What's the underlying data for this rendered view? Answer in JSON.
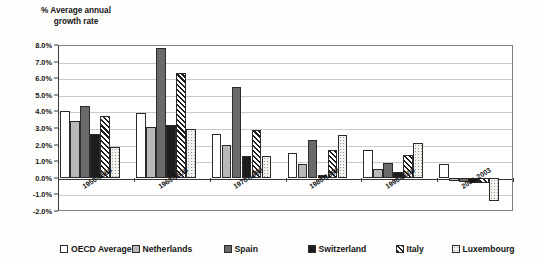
{
  "chart_data": {
    "type": "bar",
    "title": "% Average annual\ngrowth rate",
    "xlabel": "",
    "ylabel": "% Average annual growth rate",
    "ylim": [
      -2.0,
      8.0
    ],
    "ytick_step": 1.0,
    "ytick_labels": [
      "8.0%",
      "7.0%",
      "6.0%",
      "5.0%",
      "4.0%",
      "3.0%",
      "2.0%",
      "1.0%",
      "0.0%",
      "-1.0%",
      "-2.0%"
    ],
    "ytick_values": [
      8.0,
      7.0,
      6.0,
      5.0,
      4.0,
      3.0,
      2.0,
      1.0,
      0.0,
      -1.0,
      -2.0
    ],
    "grid": true,
    "legend_position": "bottom",
    "categories": [
      "1950-1960",
      "1960-1970",
      "1970-1980",
      "1980-1990",
      "1990-2000",
      "2000-2003"
    ],
    "series": [
      {
        "name": "OECD Average",
        "pattern": "white",
        "values": [
          4.05,
          3.92,
          2.62,
          1.5,
          1.7,
          0.85
        ]
      },
      {
        "name": "Netherlands",
        "pattern": "light-grey",
        "values": [
          3.42,
          3.08,
          1.98,
          0.85,
          0.55,
          -0.18
        ]
      },
      {
        "name": "Spain",
        "pattern": "dark-grey",
        "values": [
          4.32,
          7.8,
          5.45,
          2.3,
          0.9,
          -0.28
        ]
      },
      {
        "name": "Switzerland",
        "pattern": "black",
        "values": [
          2.65,
          3.18,
          1.3,
          0.15,
          0.35,
          -0.32
        ]
      },
      {
        "name": "Italy",
        "pattern": "diagonal-hatch",
        "values": [
          3.72,
          6.3,
          2.87,
          1.65,
          1.35,
          -0.3
        ]
      },
      {
        "name": "Luxembourg",
        "pattern": "dotted-white",
        "values": [
          1.88,
          2.92,
          1.33,
          2.55,
          2.1,
          -1.42
        ]
      }
    ]
  },
  "legend": {
    "items": [
      {
        "label": "OECD Average",
        "swatch": "white"
      },
      {
        "label": "Netherlands",
        "swatch": "light-grey"
      },
      {
        "label": "Spain",
        "swatch": "dark-grey"
      },
      {
        "label": "Switzerland",
        "swatch": "black"
      },
      {
        "label": "Italy",
        "swatch": "diagonal-hatch"
      },
      {
        "label": "Luxembourg",
        "swatch": "dotted-white"
      }
    ]
  },
  "colors": {
    "oecd": "#ffffff",
    "netherlands": "#b8b8b8",
    "spain": "#6a6a6a",
    "switzerland": "#1d1d1d",
    "italy": "#ffffff",
    "luxembourg": "#f2f2ee",
    "grid": "#c9c9c9",
    "axis": "#3a3a3a",
    "background": "#fdfdfb"
  }
}
